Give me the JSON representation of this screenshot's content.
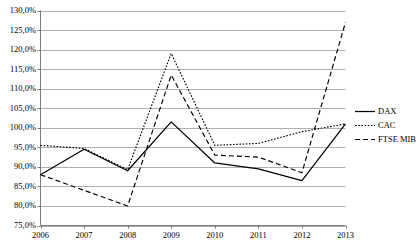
{
  "chart_data": {
    "type": "line",
    "title": "",
    "xlabel": "",
    "ylabel": "",
    "categories": [
      "2006",
      "2007",
      "2008",
      "2009",
      "2010",
      "2011",
      "2012",
      "2013"
    ],
    "x_tick_labels": [
      "2006",
      "2007",
      "2008",
      "2009",
      "2010",
      "2011",
      "2012",
      "2013"
    ],
    "y_tick_labels": [
      "75,0%",
      "80,0%",
      "85,0%",
      "90,0%",
      "95,0%",
      "100,0%",
      "105,0%",
      "110,0%",
      "115,0%",
      "120,0%",
      "125,0%",
      "130,0%"
    ],
    "y_tick_values": [
      75.0,
      80.0,
      85.0,
      90.0,
      95.0,
      100.0,
      105.0,
      110.0,
      115.0,
      120.0,
      125.0,
      130.0
    ],
    "ylim": [
      75.0,
      130.0
    ],
    "y_unit": "%",
    "grid": "horizontal",
    "legend_position": "right",
    "series": [
      {
        "name": "DAX",
        "style": "solid",
        "color": "#000000",
        "values": [
          88.0,
          94.5,
          89.0,
          101.5,
          91.0,
          89.5,
          86.5,
          101.0
        ]
      },
      {
        "name": "CAC",
        "style": "dotted",
        "color": "#000000",
        "values": [
          95.5,
          94.7,
          89.3,
          119.0,
          95.5,
          96.0,
          99.0,
          101.0
        ]
      },
      {
        "name": "FTSE MIB",
        "style": "dashed",
        "color": "#000000",
        "values": [
          88.0,
          84.0,
          80.0,
          113.5,
          93.0,
          92.5,
          88.5,
          127.0
        ]
      }
    ]
  },
  "legend": {
    "entries": [
      {
        "label": "DAX",
        "style": "solid"
      },
      {
        "label": "CAC",
        "style": "dotted"
      },
      {
        "label": "FTSE MIB",
        "style": "dashed"
      }
    ]
  },
  "colors": {
    "ink": "#000000",
    "grid": "#9a9a9a",
    "axis": "#6e6e6e",
    "background": "#ffffff"
  }
}
